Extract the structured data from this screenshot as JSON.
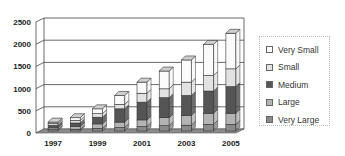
{
  "chart_data": {
    "type": "bar",
    "stacked": true,
    "three_d": true,
    "title": "",
    "xlabel": "",
    "ylabel": "",
    "categories": [
      "1997",
      "1998",
      "1999",
      "2000",
      "2001",
      "2002",
      "2003",
      "2004",
      "2005"
    ],
    "x_tick_labels": [
      "1997",
      "1999",
      "2001",
      "2003",
      "2005"
    ],
    "y_ticks": [
      0,
      500,
      1000,
      1500,
      2000,
      2500
    ],
    "ylim": [
      0,
      2500
    ],
    "grid": true,
    "legend_position": "right",
    "series": [
      {
        "name": "Very Large",
        "color": "#8a8a8a",
        "values": [
          30,
          40,
          60,
          80,
          100,
          120,
          130,
          150,
          150
        ]
      },
      {
        "name": "Large",
        "color": "#b4b4b4",
        "values": [
          40,
          60,
          100,
          120,
          150,
          180,
          220,
          250,
          250
        ]
      },
      {
        "name": "Medium",
        "color": "#555555",
        "values": [
          60,
          80,
          150,
          300,
          400,
          450,
          450,
          500,
          600
        ]
      },
      {
        "name": "Small",
        "color": "#e2e2e2",
        "values": [
          40,
          60,
          80,
          100,
          200,
          200,
          300,
          350,
          400
        ]
      },
      {
        "name": "Very Small",
        "color": "#fbfbfb",
        "values": [
          30,
          60,
          110,
          200,
          250,
          400,
          500,
          700,
          800
        ]
      }
    ],
    "totals": [
      200,
      300,
      500,
      800,
      1100,
      1350,
      1600,
      1950,
      2200
    ]
  },
  "legend": {
    "items": [
      {
        "label": "Very Small",
        "color": "#fbfbfb"
      },
      {
        "label": "Small",
        "color": "#e2e2e2"
      },
      {
        "label": "Medium",
        "color": "#555555"
      },
      {
        "label": "Large",
        "color": "#b4b4b4"
      },
      {
        "label": "Very Large",
        "color": "#8a8a8a"
      }
    ]
  }
}
